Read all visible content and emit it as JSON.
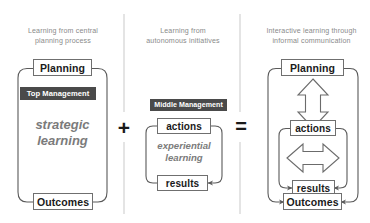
{
  "diagram": {
    "title_caption_color": "#8a8a8a",
    "panels": [
      {
        "id": "central-planning",
        "caption": "Learning from central\nplanning process",
        "badge": "Top Management",
        "center_text": "strategic\nlearning",
        "top_node": "Planning",
        "bottom_node": "Outcomes"
      },
      {
        "id": "autonomous-initiatives",
        "caption": "Learning from\nautonomous initiatives",
        "badge": "Middle Management",
        "center_text": "experiential\nlearning",
        "top_node": "actions",
        "bottom_node": "results"
      },
      {
        "id": "interactive-learning",
        "caption": "Interactive learning through\ninformal communication",
        "nodes": [
          "Planning",
          "actions",
          "results",
          "Outcomes"
        ]
      }
    ],
    "operators": {
      "plus": "+",
      "equals": "="
    },
    "colors": {
      "badge_fill": "#4a4a4a",
      "badge_text": "#ffffff",
      "node_border": "#6f6f6f",
      "node_text": "#1a1a1a",
      "caption_text": "#8a8a8a",
      "italic_text": "#7b7b7b",
      "loop_stroke": "#5a5a5a",
      "divider": "#c9c9c9",
      "block_arrow_stroke": "#6b6b6b",
      "background": "#ffffff"
    }
  }
}
